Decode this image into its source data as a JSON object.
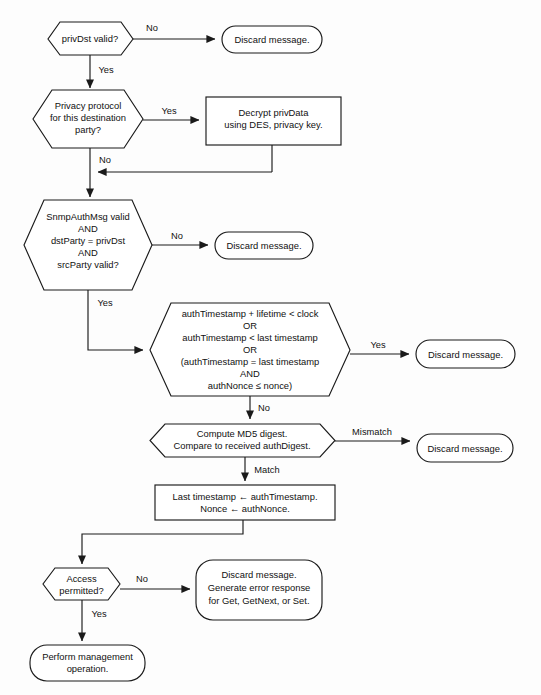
{
  "diagram": {
    "colors": {
      "background": "#fdfdfd",
      "stroke": "#1a1a1a",
      "shape_fill": "#ffffff",
      "text": "#111111"
    },
    "nodes": [
      {
        "id": "priv-dst-valid",
        "type": "decision",
        "lines": [
          "privDst valid?"
        ]
      },
      {
        "id": "discard-1",
        "type": "terminator",
        "lines": [
          "Discard message."
        ]
      },
      {
        "id": "privacy-protocol",
        "type": "decision",
        "lines": [
          "Privacy protocol",
          "for this destination",
          "party?"
        ]
      },
      {
        "id": "decrypt-privdata",
        "type": "process",
        "lines": [
          "Decrypt privData",
          "using DES, privacy key."
        ]
      },
      {
        "id": "snmp-auth-msg-valid",
        "type": "decision",
        "lines": [
          "SnmpAuthMsg valid",
          "AND",
          "dstParty = privDst",
          "AND",
          "srcParty valid?"
        ]
      },
      {
        "id": "discard-2",
        "type": "terminator",
        "lines": [
          "Discard message."
        ]
      },
      {
        "id": "timestamp-checks",
        "type": "decision",
        "lines": [
          "authTimestamp + lifetime < clock",
          "OR",
          "authTimestamp < last timestamp",
          "OR",
          "(authTimestamp = last timestamp",
          "AND",
          "authNonce ≤ nonce)"
        ]
      },
      {
        "id": "discard-3",
        "type": "terminator",
        "lines": [
          "Discard message."
        ]
      },
      {
        "id": "compute-md5",
        "type": "decision",
        "lines": [
          "Compute MD5 digest.",
          "Compare to received authDigest."
        ]
      },
      {
        "id": "discard-4",
        "type": "terminator",
        "lines": [
          "Discard message."
        ]
      },
      {
        "id": "update-state",
        "type": "process",
        "lines": [
          "Last timestamp ← authTimestamp.",
          "Nonce ← authNonce."
        ]
      },
      {
        "id": "access-permitted",
        "type": "decision",
        "lines": [
          "Access",
          "permitted?"
        ]
      },
      {
        "id": "discard-generate-error",
        "type": "terminator",
        "lines": [
          "Discard message.",
          "Generate error response",
          "for Get, GetNext, or Set."
        ]
      },
      {
        "id": "perform-management",
        "type": "terminator",
        "lines": [
          "Perform management",
          "operation."
        ]
      }
    ],
    "edge_labels": {
      "priv_dst_no": "No",
      "priv_dst_yes": "Yes",
      "privacy_yes": "Yes",
      "privacy_no": "No",
      "auth_no": "No",
      "auth_yes": "Yes",
      "timestamp_yes": "Yes",
      "timestamp_no": "No",
      "md5_mismatch": "Mismatch",
      "md5_match": "Match",
      "access_no": "No",
      "access_yes": "Yes"
    }
  }
}
